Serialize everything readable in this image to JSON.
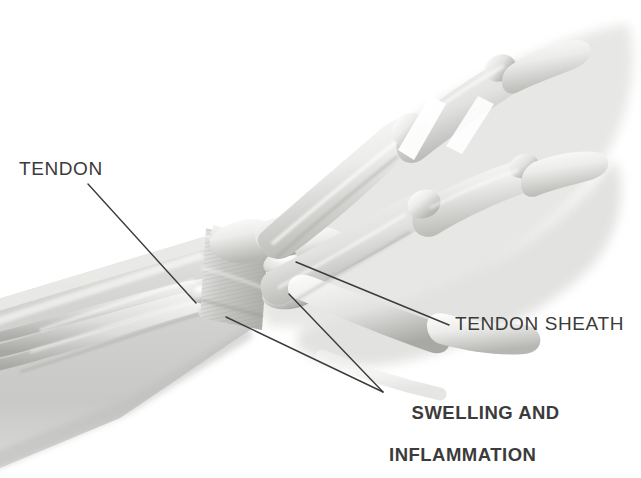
{
  "illustration": {
    "subject": "hand-wrist-tendon-anatomy",
    "style": "greyscale-medical-illustration",
    "palette": {
      "background": "#ffffff",
      "label_text": "#3b3b3b",
      "leader_line": "#3b3b3b",
      "bone_light": "#f2f2f1",
      "bone_mid": "#d9d9d7",
      "bone_shadow": "#a9a9a7",
      "flesh_ghost": "#dcdcda",
      "forearm_grey": "#cfcfcd",
      "sheath_grey": "#c4c4c2"
    }
  },
  "labels": [
    {
      "id": "tendon",
      "text": "TENDON",
      "weight": "regular",
      "x": 19,
      "y": 158,
      "leader": {
        "from": [
          88,
          184
        ],
        "to": [
          196,
          303
        ]
      }
    },
    {
      "id": "tendon-sheath",
      "text": "TENDON SHEATH",
      "weight": "regular",
      "x": 455,
      "y": 313,
      "leader": {
        "from": [
          449,
          325
        ],
        "to": [
          296,
          262
        ]
      }
    },
    {
      "id": "swelling-inflammation",
      "line1": "SWELLING AND",
      "line2": "INFLAMMATION",
      "weight": "bold",
      "x": 389,
      "y": 381,
      "leaders": [
        {
          "from": [
            383,
            392
          ],
          "to": [
            226,
            317
          ]
        },
        {
          "from": [
            383,
            392
          ],
          "to": [
            289,
            294
          ]
        }
      ]
    }
  ],
  "anatomy_parts": [
    {
      "name": "forearm",
      "description": "grey tapering forearm wedge entering from lower-left"
    },
    {
      "name": "tendons",
      "description": "parallel tendon cords running from forearm to wrist"
    },
    {
      "name": "tendon-sheath",
      "description": "striated fibrous band wrapping the wrist"
    },
    {
      "name": "swollen-nodules",
      "description": "two bulbous inflamed swellings at the sheath exit"
    },
    {
      "name": "metacarpals",
      "description": "long hand bones"
    },
    {
      "name": "phalanges",
      "description": "finger bones in relaxed curve"
    },
    {
      "name": "thumb",
      "description": "thumb bones and ghosted flesh"
    },
    {
      "name": "hand-silhouette",
      "description": "faint translucent hand outline"
    }
  ]
}
